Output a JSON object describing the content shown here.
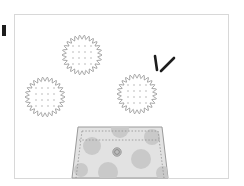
{
  "scene": {
    "title": "Cookies and cookie jar illustration",
    "background_color": "#ffffff",
    "canvas": {
      "width": 244,
      "height": 186
    }
  },
  "frame": {
    "label": "Illustration frame",
    "x": 14,
    "y": 14,
    "width": 214,
    "height": 164,
    "border_color": "#d8d8d8",
    "fill_color": "#ffffff",
    "border_width": 1
  },
  "corner_mark": {
    "label": "Dark corner mark",
    "x": 2,
    "y": 25,
    "width": 4,
    "height": 11,
    "color": "#1d1d1d"
  },
  "cookies": [
    {
      "name": "top-cookie",
      "label": "Top scalloped cookie",
      "cx": 82,
      "cy": 55,
      "radius": 20,
      "scallops": 26,
      "scallop_depth": 2.1,
      "outline_color": "#9a9a9a",
      "fill_color": "#ffffff",
      "dot_color": "#b4b4b4",
      "dot_rows": 4,
      "dot_cols": 4,
      "dot_spacing": 6,
      "dot_radius": 0.8
    },
    {
      "name": "left-cookie",
      "label": "Left scalloped cookie",
      "cx": 45,
      "cy": 97,
      "radius": 20,
      "scallops": 26,
      "scallop_depth": 2.1,
      "outline_color": "#9a9a9a",
      "fill_color": "#ffffff",
      "dot_color": "#b4b4b4",
      "dot_rows": 4,
      "dot_cols": 4,
      "dot_spacing": 6,
      "dot_radius": 0.8
    },
    {
      "name": "right-cookie",
      "label": "Right scalloped cookie",
      "cx": 137,
      "cy": 94,
      "radius": 20,
      "scallops": 26,
      "scallop_depth": 2.1,
      "outline_color": "#9a9a9a",
      "fill_color": "#ffffff",
      "dot_color": "#b4b4b4",
      "dot_rows": 4,
      "dot_cols": 4,
      "dot_spacing": 6,
      "dot_radius": 0.8
    }
  ],
  "sticks": [
    {
      "name": "vertical-stick",
      "label": "Vertical dark stick",
      "x1": 155,
      "y1": 56,
      "x2": 157,
      "y2": 70,
      "color": "#1d1d1d",
      "width": 2.6
    },
    {
      "name": "diagonal-stick",
      "label": "Diagonal dark stick",
      "x1": 161,
      "y1": 71,
      "x2": 174,
      "y2": 58,
      "color": "#1d1d1d",
      "width": 2.6
    }
  ],
  "jar": {
    "name": "cookie-jar",
    "label": "Polka dot cookie jar",
    "top_left_x": 78,
    "top_right_x": 162,
    "bottom_left_x": 72,
    "bottom_right_x": 168,
    "top_y": 127,
    "bottom_y": 178,
    "fill_color": "#e2e2e2",
    "outline_color": "#9a9a9a",
    "outline_width": 1,
    "stitch_color": "#8f8f8f",
    "stitch_dash": "1.5 1.8",
    "stitch_inset": 4,
    "band_y": 140,
    "dot_color": "#c9c9c9",
    "dots": [
      {
        "cx": 92,
        "cy": 146,
        "r": 9
      },
      {
        "cx": 120,
        "cy": 129,
        "r": 9
      },
      {
        "cx": 152,
        "cy": 137,
        "r": 8
      },
      {
        "cx": 141,
        "cy": 159,
        "r": 10
      },
      {
        "cx": 108,
        "cy": 172,
        "r": 10
      },
      {
        "cx": 81,
        "cy": 170,
        "r": 7
      },
      {
        "cx": 163,
        "cy": 173,
        "r": 7
      }
    ],
    "button": {
      "name": "jar-button",
      "label": "Jar center button",
      "cx": 117,
      "cy": 152,
      "outer_r": 4.2,
      "inner_r": 2.4,
      "outer_color": "#9a9a9a",
      "inner_color": "#bdbdbd",
      "ring_color": "#7d7d7d"
    }
  }
}
